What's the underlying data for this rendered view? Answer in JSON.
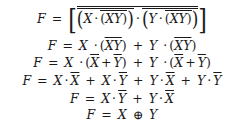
{
  "derivation": {
    "lines": [
      {
        "id": "line1",
        "lhs": "F",
        "eq": "=",
        "a": "X",
        "dot": "·",
        "b": "XY",
        "c": "Y",
        "d": "XY"
      },
      {
        "id": "line2",
        "lhs": "F",
        "eq": "=",
        "a": "X",
        "dot": "·",
        "b": "XY",
        "plus": "+",
        "c": "Y",
        "d": "XY"
      },
      {
        "id": "line3",
        "lhs": "F",
        "eq": "=",
        "a": "X",
        "dot": "·",
        "b1": "X",
        "plus": "+",
        "b2": "Y",
        "c": "Y",
        "d1": "X",
        "d2": "Y"
      },
      {
        "id": "line4",
        "lhs": "F",
        "eq": "=",
        "t1a": "X",
        "t1b": "X",
        "t2a": "X",
        "t2b": "Y",
        "t3a": "Y",
        "t3b": "X",
        "t4a": "Y",
        "t4b": "Y",
        "dot": "·",
        "plus": "+"
      },
      {
        "id": "line5",
        "lhs": "F",
        "eq": "=",
        "t1a": "X",
        "t1b": "Y",
        "t2a": "Y",
        "t2b": "X",
        "dot": "·",
        "plus": "+"
      },
      {
        "id": "line6",
        "lhs": "F",
        "eq": "=",
        "a": "X",
        "op": "⊕",
        "b": "Y"
      }
    ]
  }
}
